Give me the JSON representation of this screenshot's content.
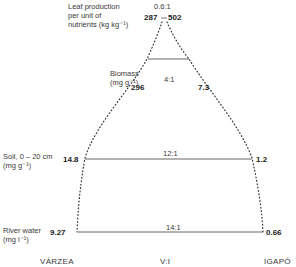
{
  "diagram": {
    "levels": [
      {
        "id": "leaf-production",
        "label_lines": [
          "Leaf production",
          "per unit of",
          "nutrients (kg kg⁻¹)"
        ],
        "varzea_value": "287",
        "igapo_value": "502",
        "ratio": "0.6:1"
      },
      {
        "id": "biomass",
        "label_lines": [
          "Biomass",
          "(mg g⁻¹)"
        ],
        "varzea_value": "296",
        "igapo_value": "7.3",
        "ratio": "4:1"
      },
      {
        "id": "soil",
        "label_lines": [
          "Soil, 0 – 20 cm",
          "(mg g⁻¹)"
        ],
        "varzea_value": "14.8",
        "igapo_value": "1.2",
        "ratio": "12:1"
      },
      {
        "id": "river-water",
        "label_lines": [
          "River water",
          "(mg l⁻¹)"
        ],
        "varzea_value": "9.27",
        "igapo_value": "0.66",
        "ratio": "14:1"
      }
    ],
    "axis_labels": {
      "left": "VÁRZEA",
      "center": "V:I",
      "right": "IGAPÓ"
    },
    "colors": {
      "line": "#555555",
      "dots": "#333333",
      "text": "#2a2a2a"
    }
  }
}
